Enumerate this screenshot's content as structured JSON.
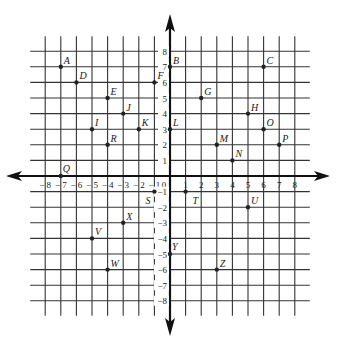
{
  "diagram": {
    "type": "coordinate-plane",
    "x_range": [
      -8,
      8
    ],
    "y_range": [
      -8,
      8
    ],
    "origin_label": "0",
    "x_tick_labels": [
      "-8",
      "-7",
      "-6",
      "-5",
      "-4",
      "-3",
      "-2",
      "-1",
      "1",
      "2",
      "3",
      "4",
      "5",
      "6",
      "7",
      "8"
    ],
    "y_tick_labels": [
      "8",
      "7",
      "6",
      "5",
      "4",
      "3",
      "2",
      "1",
      "-1",
      "-2",
      "-3",
      "-4",
      "-5",
      "-6",
      "-7",
      "-8"
    ],
    "colors": {
      "grid": "#333333",
      "axis": "#111111",
      "point": "#222222",
      "background": "#ffffff"
    },
    "points": [
      {
        "label": "A",
        "x": -7,
        "y": 7
      },
      {
        "label": "B",
        "x": 0,
        "y": 7
      },
      {
        "label": "C",
        "x": 6,
        "y": 7
      },
      {
        "label": "D",
        "x": -6,
        "y": 6
      },
      {
        "label": "E",
        "x": -4,
        "y": 5
      },
      {
        "label": "F",
        "x": -1,
        "y": 6
      },
      {
        "label": "G",
        "x": 2,
        "y": 5
      },
      {
        "label": "H",
        "x": 5,
        "y": 4
      },
      {
        "label": "I",
        "x": -5,
        "y": 3
      },
      {
        "label": "J",
        "x": -3,
        "y": 4
      },
      {
        "label": "K",
        "x": -2,
        "y": 3
      },
      {
        "label": "L",
        "x": 0,
        "y": 3
      },
      {
        "label": "M",
        "x": 3,
        "y": 2
      },
      {
        "label": "N",
        "x": 4,
        "y": 1
      },
      {
        "label": "O",
        "x": 6,
        "y": 3
      },
      {
        "label": "P",
        "x": 7,
        "y": 2
      },
      {
        "label": "Q",
        "x": -7,
        "y": 0
      },
      {
        "label": "R",
        "x": -4,
        "y": 2
      },
      {
        "label": "S",
        "x": -1,
        "y": -1
      },
      {
        "label": "T",
        "x": 1,
        "y": -1
      },
      {
        "label": "U",
        "x": 5,
        "y": -2
      },
      {
        "label": "V",
        "x": -5,
        "y": -4
      },
      {
        "label": "W",
        "x": -4,
        "y": -6
      },
      {
        "label": "X",
        "x": -3,
        "y": -3
      },
      {
        "label": "Y",
        "x": 0,
        "y": -5
      },
      {
        "label": "Z",
        "x": 3,
        "y": -6
      }
    ]
  }
}
